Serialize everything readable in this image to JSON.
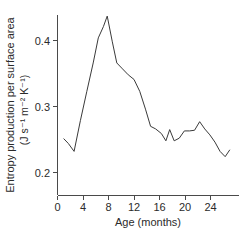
{
  "chart_data": {
    "type": "line",
    "title": "",
    "xlabel": "Age (months)",
    "ylabel_line1": "Entropy production per surface area",
    "ylabel_line2": "(J s⁻¹ m⁻² K⁻¹)",
    "ylabel_full": "Entropy production per surface area (J s⁻¹ m⁻² K⁻¹)",
    "xlim": [
      0,
      27.5
    ],
    "ylim": [
      0.175,
      0.447
    ],
    "xticks": [
      0,
      4,
      8,
      12,
      16,
      20,
      24
    ],
    "xticklabels": [
      "0",
      "4",
      "8",
      "12",
      "16",
      "20",
      "24"
    ],
    "yticks": [
      0.2,
      0.3,
      0.4
    ],
    "yticklabels": [
      "0.2",
      "0.3",
      "0.4"
    ],
    "grid": false,
    "legend": false,
    "line_color": "#3a3a3a",
    "axis_color": "#4a4a4a",
    "series": [
      {
        "name": "Entropy production per surface area",
        "x": [
          1.0,
          1.7,
          2.6,
          3.6,
          4.6,
          5.6,
          6.4,
          7.2,
          7.8,
          8.6,
          9.3,
          10.2,
          11.1,
          12.0,
          12.9,
          13.8,
          14.6,
          15.4,
          16.3,
          17.0,
          17.6,
          18.3,
          19.1,
          19.9,
          20.7,
          21.5,
          22.3,
          23.1,
          23.9,
          24.7,
          25.5,
          26.3,
          27.0
        ],
        "y": [
          0.251,
          0.244,
          0.232,
          0.279,
          0.323,
          0.366,
          0.404,
          0.421,
          0.437,
          0.398,
          0.366,
          0.357,
          0.348,
          0.341,
          0.323,
          0.296,
          0.27,
          0.266,
          0.259,
          0.248,
          0.265,
          0.248,
          0.252,
          0.263,
          0.263,
          0.264,
          0.277,
          0.266,
          0.257,
          0.246,
          0.232,
          0.224,
          0.234
        ]
      }
    ]
  },
  "axes": {
    "x_tick_count": 7,
    "y_tick_count": 3
  }
}
